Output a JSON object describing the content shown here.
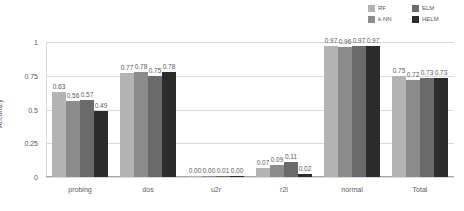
{
  "chart_data": {
    "type": "bar",
    "title": "",
    "xlabel": "",
    "ylabel": "Accuracy",
    "ylim": [
      0,
      1
    ],
    "yticks": [
      "0",
      "0.25",
      "0.5",
      "0.75",
      "1"
    ],
    "grid": true,
    "legend_position": "top-right",
    "categories": [
      "probing",
      "dos",
      "u2r",
      "r2l",
      "normal",
      "Total"
    ],
    "series": [
      {
        "name": "RF",
        "color": "#b3b3b3",
        "values": [
          0.63,
          0.77,
          0.0,
          0.07,
          0.97,
          0.75
        ],
        "labels": [
          "0.63",
          "0.77",
          "0.00",
          "0.07",
          "0.97",
          "0.75"
        ]
      },
      {
        "name": "k-NN",
        "color": "#8c8c8c",
        "values": [
          0.56,
          0.78,
          0.0,
          0.09,
          0.96,
          0.72
        ],
        "labels": [
          "0.56",
          "0.78",
          "0.00",
          "0.09",
          "0.96",
          "0.72"
        ]
      },
      {
        "name": "ELM",
        "color": "#6b6b6b",
        "values": [
          0.57,
          0.75,
          0.01,
          0.11,
          0.97,
          0.73
        ],
        "labels": [
          "0.57",
          "0.75",
          "0.01",
          "0.11",
          "0.97",
          "0.73"
        ]
      },
      {
        "name": "HELM",
        "color": "#2b2b2b",
        "values": [
          0.49,
          0.78,
          0.0,
          0.02,
          0.97,
          0.73
        ],
        "labels": [
          "0.49",
          "0.78",
          "0.00",
          "0.02",
          "0.97",
          "0.73"
        ]
      }
    ]
  },
  "legend": {
    "items": [
      {
        "label": "RF",
        "color": "#b3b3b3"
      },
      {
        "label": "ELM",
        "color": "#6b6b6b"
      },
      {
        "label": "k-NN",
        "color": "#8c8c8c"
      },
      {
        "label": "HELM",
        "color": "#2b2b2b"
      }
    ]
  },
  "colors": {
    "gridline": "#d9d9d9",
    "axis": "#a6a6a6",
    "text": "#5a5a5a",
    "background": "#ffffff"
  }
}
